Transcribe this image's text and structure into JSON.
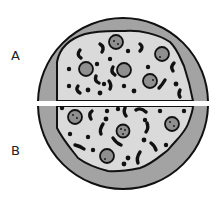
{
  "diagram": {
    "pieces": [
      {
        "label": "A",
        "position": "top"
      },
      {
        "label": "B",
        "position": "bottom"
      }
    ],
    "colors": {
      "crust": "#a3a3a3",
      "cheese": "#dadada",
      "topping": "#8f8f8f",
      "outline": "#111111",
      "highlight": "#ffffff"
    }
  }
}
